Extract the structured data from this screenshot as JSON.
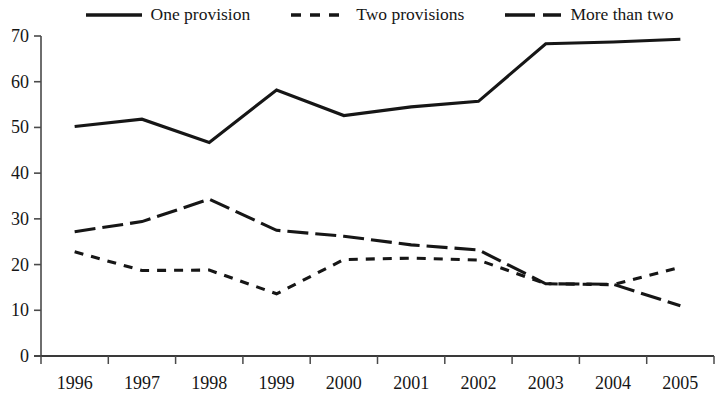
{
  "chart_data": {
    "type": "line",
    "title": "",
    "subtitle": "",
    "xlabel": "",
    "ylabel": "",
    "categories": [
      "1996",
      "1997",
      "1998",
      "1999",
      "2000",
      "2001",
      "2002",
      "2003",
      "2004",
      "2005"
    ],
    "xlim": [
      1995.5,
      2005.5
    ],
    "ylim": [
      0,
      70
    ],
    "yticks": [
      0,
      10,
      20,
      30,
      40,
      50,
      60,
      70
    ],
    "grid": false,
    "legend_position": "top",
    "series": [
      {
        "name": "One provision",
        "style": "solid",
        "color": "#161616",
        "values": [
          50.2,
          51.8,
          46.7,
          58.2,
          52.6,
          54.5,
          55.7,
          68.3,
          68.7,
          69.3
        ]
      },
      {
        "name": "Two provisions",
        "style": "dashed",
        "color": "#161616",
        "values": [
          22.8,
          18.7,
          18.8,
          13.6,
          21.1,
          21.4,
          21.0,
          15.8,
          15.6,
          19.4
        ]
      },
      {
        "name": "More than two",
        "style": "long-dashed",
        "color": "#161616",
        "values": [
          27.2,
          29.4,
          34.3,
          27.5,
          26.2,
          24.3,
          23.2,
          15.8,
          15.7,
          11.0
        ]
      }
    ]
  },
  "legend": {
    "items": [
      {
        "label": "One provision",
        "style": "solid"
      },
      {
        "label": "Two provisions",
        "style": "dashed"
      },
      {
        "label": "More than two",
        "style": "long-dashed"
      }
    ]
  },
  "axes": {
    "y_tick_labels": [
      "70",
      "60",
      "50",
      "40",
      "30",
      "20",
      "10",
      "0"
    ],
    "x_tick_labels": [
      "1996",
      "1997",
      "1998",
      "1999",
      "2000",
      "2001",
      "2002",
      "2003",
      "2004",
      "2005"
    ]
  }
}
